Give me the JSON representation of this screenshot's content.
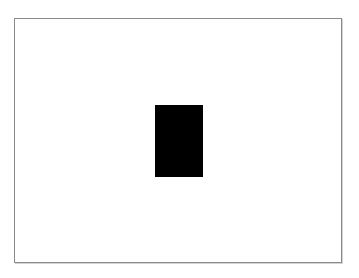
{
  "canvas": {
    "background_color": "#ffffff",
    "border_color": "#8a8a8a"
  },
  "shapes": [
    {
      "type": "rectangle",
      "fill_color": "#000000"
    }
  ]
}
